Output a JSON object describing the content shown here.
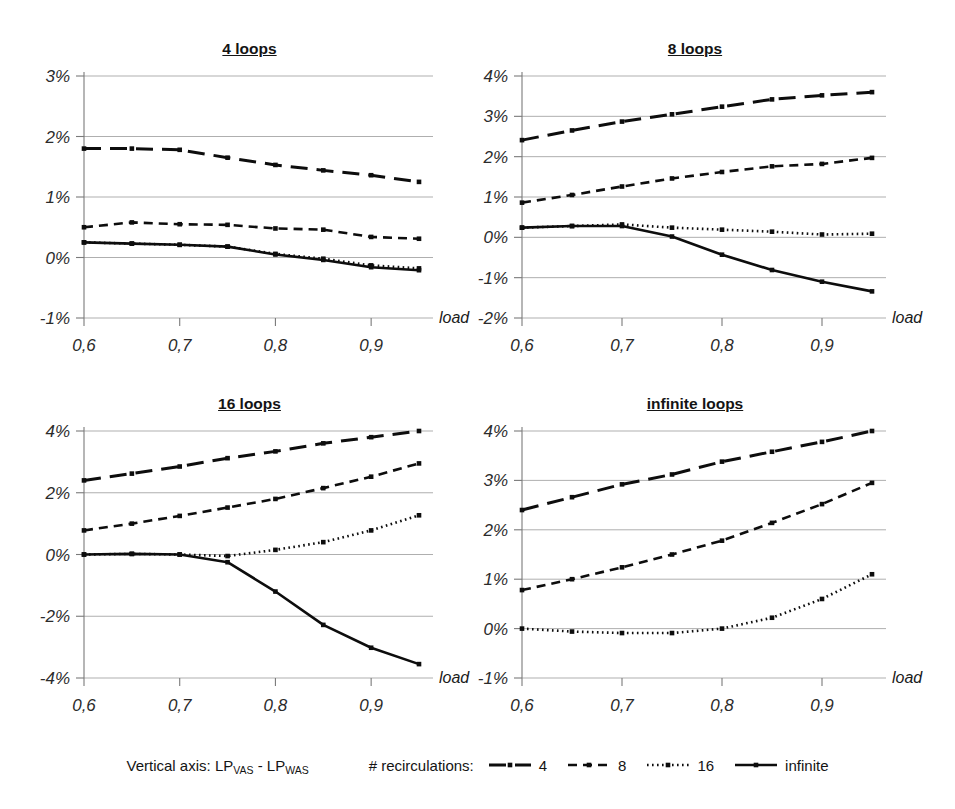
{
  "figure": {
    "background": "#ffffff",
    "ink_color": "#0d0d0d",
    "grid_color": "#a6a6a6"
  },
  "legend": {
    "axis_note_prefix": "Vertical axis: LP",
    "axis_note_sub1": "VAS",
    "axis_note_mid": " - LP",
    "axis_note_sub2": "WAS",
    "series_title": "# recirculations:",
    "entries": [
      {
        "label": "4",
        "style": "long-dash"
      },
      {
        "label": "8",
        "style": "dash"
      },
      {
        "label": "16",
        "style": "dot"
      },
      {
        "label": "infinite",
        "style": "solid"
      }
    ]
  },
  "chart_data": [
    {
      "type": "line",
      "title": "4 loops",
      "xlabel": "load",
      "ylabel": "",
      "x": [
        0.6,
        0.65,
        0.7,
        0.75,
        0.8,
        0.85,
        0.9,
        0.95
      ],
      "xticks": [
        0.6,
        0.7,
        0.8,
        0.9
      ],
      "xticklabels": [
        "0,6",
        "0,7",
        "0,8",
        "0,9"
      ],
      "xlim": [
        0.6,
        0.95
      ],
      "ylim": [
        -1,
        3
      ],
      "yticks": [
        -1,
        0,
        1,
        2,
        3
      ],
      "yticklabels": [
        "-1%",
        "0%",
        "1%",
        "2%",
        "3%"
      ],
      "grid": true,
      "series": [
        {
          "name": "4",
          "style": "long-dash",
          "values": [
            1.8,
            1.8,
            1.78,
            1.65,
            1.53,
            1.44,
            1.36,
            1.25
          ]
        },
        {
          "name": "8",
          "style": "dash",
          "values": [
            0.5,
            0.58,
            0.55,
            0.54,
            0.48,
            0.46,
            0.34,
            0.31
          ]
        },
        {
          "name": "16",
          "style": "dot",
          "values": [
            0.25,
            0.23,
            0.21,
            0.18,
            0.06,
            -0.02,
            -0.13,
            -0.18
          ]
        },
        {
          "name": "infinite",
          "style": "solid",
          "values": [
            0.25,
            0.23,
            0.21,
            0.18,
            0.05,
            -0.04,
            -0.16,
            -0.21
          ]
        }
      ]
    },
    {
      "type": "line",
      "title": "8 loops",
      "xlabel": "load",
      "ylabel": "",
      "x": [
        0.6,
        0.65,
        0.7,
        0.75,
        0.8,
        0.85,
        0.9,
        0.95
      ],
      "xticks": [
        0.6,
        0.7,
        0.8,
        0.9
      ],
      "xticklabels": [
        "0,6",
        "0,7",
        "0,8",
        "0,9"
      ],
      "xlim": [
        0.6,
        0.95
      ],
      "ylim": [
        -2,
        4
      ],
      "yticks": [
        -2,
        -1,
        0,
        1,
        2,
        3,
        4
      ],
      "yticklabels": [
        "-2%",
        "-1%",
        "0%",
        "1%",
        "2%",
        "3%",
        "4%"
      ],
      "grid": true,
      "series": [
        {
          "name": "4",
          "style": "long-dash",
          "values": [
            2.41,
            2.65,
            2.87,
            3.05,
            3.24,
            3.42,
            3.52,
            3.6
          ]
        },
        {
          "name": "8",
          "style": "dash",
          "values": [
            0.86,
            1.05,
            1.26,
            1.46,
            1.62,
            1.76,
            1.82,
            1.97
          ]
        },
        {
          "name": "16",
          "style": "dot",
          "values": [
            0.24,
            0.28,
            0.32,
            0.24,
            0.19,
            0.14,
            0.07,
            0.09
          ]
        },
        {
          "name": "infinite",
          "style": "solid",
          "values": [
            0.24,
            0.28,
            0.28,
            0.02,
            -0.43,
            -0.81,
            -1.1,
            -1.34
          ]
        }
      ]
    },
    {
      "type": "line",
      "title": "16 loops",
      "xlabel": "load",
      "ylabel": "",
      "x": [
        0.6,
        0.65,
        0.7,
        0.75,
        0.8,
        0.85,
        0.9,
        0.95
      ],
      "xticks": [
        0.6,
        0.7,
        0.8,
        0.9
      ],
      "xticklabels": [
        "0,6",
        "0,7",
        "0,8",
        "0,9"
      ],
      "xlim": [
        0.6,
        0.95
      ],
      "ylim": [
        -4,
        4
      ],
      "yticks": [
        -4,
        -2,
        0,
        2,
        4
      ],
      "yticklabels": [
        "-4%",
        "-2%",
        "0%",
        "2%",
        "4%"
      ],
      "grid": true,
      "series": [
        {
          "name": "4",
          "style": "long-dash",
          "values": [
            2.4,
            2.62,
            2.85,
            3.12,
            3.34,
            3.6,
            3.8,
            4.0
          ]
        },
        {
          "name": "8",
          "style": "dash",
          "values": [
            0.78,
            1.0,
            1.25,
            1.52,
            1.8,
            2.15,
            2.52,
            2.95
          ]
        },
        {
          "name": "16",
          "style": "dot",
          "values": [
            0.0,
            0.02,
            0.0,
            -0.05,
            0.15,
            0.4,
            0.78,
            1.27
          ]
        },
        {
          "name": "infinite",
          "style": "solid",
          "values": [
            0.0,
            0.02,
            0.0,
            -0.25,
            -1.2,
            -2.28,
            -3.02,
            -3.55
          ]
        }
      ]
    },
    {
      "type": "line",
      "title": "infinite loops",
      "xlabel": "load",
      "ylabel": "",
      "x": [
        0.6,
        0.65,
        0.7,
        0.75,
        0.8,
        0.85,
        0.9,
        0.95
      ],
      "xticks": [
        0.6,
        0.7,
        0.8,
        0.9
      ],
      "xticklabels": [
        "0,6",
        "0,7",
        "0,8",
        "0,9"
      ],
      "xlim": [
        0.6,
        0.95
      ],
      "ylim": [
        -1,
        4
      ],
      "yticks": [
        -1,
        0,
        1,
        2,
        3,
        4
      ],
      "yticklabels": [
        "-1%",
        "0%",
        "1%",
        "2%",
        "3%",
        "4%"
      ],
      "grid": true,
      "series": [
        {
          "name": "4",
          "style": "long-dash",
          "values": [
            2.4,
            2.66,
            2.92,
            3.12,
            3.38,
            3.58,
            3.78,
            4.0
          ]
        },
        {
          "name": "8",
          "style": "dash",
          "values": [
            0.78,
            1.0,
            1.24,
            1.5,
            1.78,
            2.14,
            2.52,
            2.95
          ]
        },
        {
          "name": "16",
          "style": "dot",
          "values": [
            0.0,
            -0.06,
            -0.09,
            -0.09,
            0.0,
            0.22,
            0.6,
            1.1
          ]
        }
      ]
    }
  ],
  "panel_geometry": [
    {
      "left": 22,
      "top": 40,
      "width": 455,
      "height": 340
    },
    {
      "left": 460,
      "top": 40,
      "width": 470,
      "height": 340
    },
    {
      "left": 22,
      "top": 395,
      "width": 455,
      "height": 345
    },
    {
      "left": 460,
      "top": 395,
      "width": 470,
      "height": 345
    }
  ]
}
